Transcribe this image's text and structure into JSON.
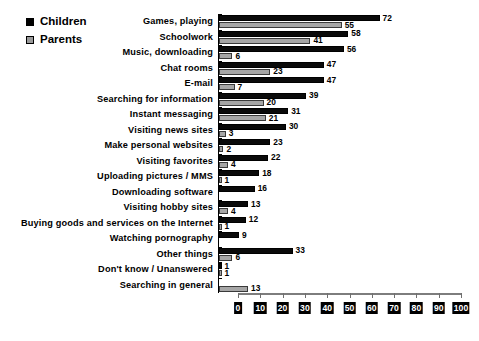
{
  "legend": {
    "items": [
      {
        "label": "Children",
        "color": "#000000",
        "key": "children"
      },
      {
        "label": "Parents",
        "color": "#9a9a9a",
        "key": "parents"
      }
    ]
  },
  "chart_data": {
    "type": "bar",
    "orientation": "horizontal",
    "title": "",
    "subtitle": "",
    "xlabel": "",
    "ylabel": "",
    "xlim": [
      0,
      100
    ],
    "xticks": [
      0,
      10,
      20,
      30,
      40,
      50,
      60,
      70,
      80,
      90,
      100
    ],
    "xtick_labels": [
      "0",
      "10",
      "20",
      "30",
      "40",
      "50",
      "60",
      "70",
      "80",
      "90",
      "100"
    ],
    "grid": false,
    "legend_position": "top-left",
    "categories": [
      "Games, playing",
      "Schoolwork",
      "Music, downloading",
      "Chat rooms",
      "E-mail",
      "Searching for information",
      "Instant messaging",
      "Visiting news sites",
      "Make personal websites",
      "Visiting favorites",
      "Uploading pictures / MMS",
      "Downloading software",
      "Visiting hobby sites",
      "Buying goods and services on the Internet",
      "Watching pornography",
      "Other things",
      "Don't know / Unanswered",
      "Searching in general"
    ],
    "series": [
      {
        "name": "Children",
        "color": "#000000",
        "values": [
          72,
          58,
          56,
          47,
          47,
          39,
          31,
          30,
          23,
          22,
          18,
          16,
          13,
          12,
          9,
          33,
          1,
          null
        ],
        "labels": [
          "72",
          "58",
          "56",
          "47",
          "47",
          "39",
          "31",
          "30",
          "23",
          "22",
          "18",
          "16",
          "13",
          "12",
          "9",
          "33",
          "1",
          ""
        ]
      },
      {
        "name": "Parents",
        "color": "#9a9a9a",
        "values": [
          55,
          41,
          6,
          23,
          7,
          20,
          21,
          3,
          2,
          4,
          1,
          null,
          4,
          1,
          null,
          6,
          1,
          13
        ],
        "labels": [
          "55",
          "41",
          "6",
          "23",
          "7",
          "20",
          "21",
          "3",
          "2",
          "4",
          "1",
          "",
          "4",
          "1",
          "",
          "6",
          "1",
          "13"
        ]
      }
    ]
  }
}
